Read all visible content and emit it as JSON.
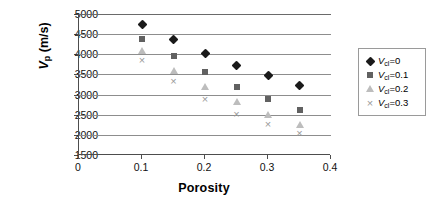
{
  "chart_data": {
    "type": "scatter",
    "title": "",
    "xlabel": "Porosity",
    "ylabel": "Vp (m/s)",
    "ylabel_symbol": "V",
    "ylabel_subscript": "p",
    "ylabel_unit": "(m/s)",
    "xlim": [
      0,
      0.4
    ],
    "ylim": [
      1500,
      5000
    ],
    "xticks": [
      "0",
      "0.1",
      "0.2",
      "0.3",
      "0.4"
    ],
    "xtick_values": [
      0,
      0.1,
      0.2,
      0.3,
      0.4
    ],
    "yticks": [
      "1500",
      "2000",
      "2500",
      "3000",
      "3500",
      "4000",
      "4500",
      "5000"
    ],
    "ytick_values": [
      1500,
      2000,
      2500,
      3000,
      3500,
      4000,
      4500,
      5000
    ],
    "grid": "horizontal",
    "legend_position": "right",
    "x": [
      0.1,
      0.15,
      0.2,
      0.25,
      0.3,
      0.35
    ],
    "series": [
      {
        "name": "Vcl=0",
        "label_symbol": "V",
        "label_subscript": "cl",
        "label_value": "=0",
        "marker": "diamond",
        "color": "#1a1a1a",
        "values": [
          4750,
          4370,
          4030,
          3730,
          3480,
          3220
        ]
      },
      {
        "name": "Vcl=0.1",
        "label_symbol": "V",
        "label_subscript": "cl",
        "label_value": "=0.1",
        "marker": "square",
        "color": "#616161",
        "values": [
          4390,
          3950,
          3550,
          3200,
          2890,
          2610
        ]
      },
      {
        "name": "Vcl=0.2",
        "label_symbol": "V",
        "label_subscript": "cl",
        "label_value": "=0.2",
        "marker": "triangle",
        "color": "#bdbdbd",
        "values": [
          4080,
          3580,
          3180,
          2820,
          2500,
          2240
        ]
      },
      {
        "name": "Vcl=0.3",
        "label_symbol": "V",
        "label_subscript": "cl",
        "label_value": "=0.3",
        "marker": "cross",
        "color": "#9a9a9a",
        "values": [
          3850,
          3330,
          2890,
          2530,
          2260,
          2040
        ]
      }
    ]
  }
}
